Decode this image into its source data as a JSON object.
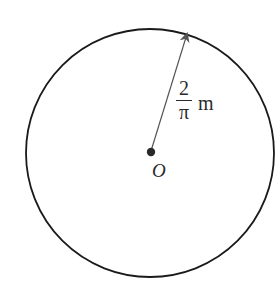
{
  "diagram": {
    "shape": "circle",
    "center_label": "O",
    "radius_label": {
      "numerator": "2",
      "denominator": "π",
      "unit": "m"
    },
    "colors": {
      "circle_stroke": "#1a1a1a",
      "arrow": "#555555",
      "center_dot": "#2a2a2a"
    }
  }
}
